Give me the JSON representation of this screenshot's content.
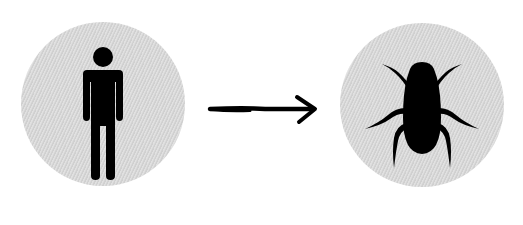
{
  "diagram": {
    "type": "transformation",
    "from": {
      "label": "person",
      "icon": "person-icon",
      "circle_color": "#d8d8d8",
      "icon_color": "#000000"
    },
    "connector": {
      "label": "arrow",
      "icon": "arrow-right-icon",
      "color": "#000000"
    },
    "to": {
      "label": "cockroach",
      "icon": "cockroach-icon",
      "circle_color": "#d8d8d8",
      "icon_color": "#000000"
    }
  }
}
